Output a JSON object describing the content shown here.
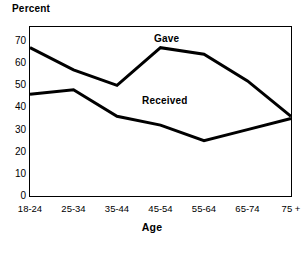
{
  "title": "",
  "axis_caption": {
    "y": "Percent",
    "x": "Age"
  },
  "annotations": {
    "gave": "Gave",
    "received": "Received"
  },
  "y_ticks": [
    "70",
    "60",
    "50",
    "40",
    "30",
    "20",
    "10",
    "0"
  ],
  "x_ticks": [
    "18-24",
    "25-34",
    "35-44",
    "45-54",
    "55-64",
    "65-74",
    "75 +"
  ],
  "colors": {
    "line": "#000000",
    "frame": "#000000",
    "background": "#ffffff",
    "text": "#000000"
  },
  "chart_data": {
    "type": "line",
    "title": "",
    "subtitle": "",
    "xlabel": "Age",
    "ylabel": "Percent",
    "categories": [
      "18-24",
      "25-34",
      "35-44",
      "45-54",
      "55-64",
      "65-74",
      "75 +"
    ],
    "series": [
      {
        "name": "Gave",
        "values": [
          67,
          57,
          50,
          67,
          64,
          52,
          36
        ]
      },
      {
        "name": "Received",
        "values": [
          46,
          48,
          36,
          32,
          25,
          30,
          35
        ]
      }
    ],
    "ylim": [
      0,
      75
    ],
    "yticks": [
      0,
      10,
      20,
      30,
      40,
      50,
      60,
      70
    ],
    "grid": false,
    "legend": "inline-annotations",
    "legend_position": "in-plot",
    "line_width": 3,
    "line_color": "#000000"
  }
}
